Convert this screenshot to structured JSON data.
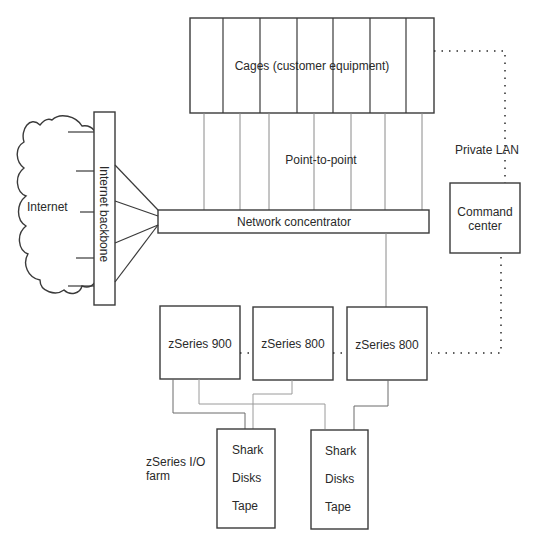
{
  "diagram": {
    "cages": {
      "label": "Cages (customer equipment)",
      "slots": 7
    },
    "point_to_point": {
      "label": "Point-to-point"
    },
    "private_lan": {
      "label": "Private LAN"
    },
    "internet": {
      "label": "Internet"
    },
    "backbone": {
      "label": "Internet backbone"
    },
    "concentrator": {
      "label": "Network concentrator"
    },
    "command_center": {
      "line1": "Command",
      "line2": "center"
    },
    "servers": [
      {
        "label": "zSeries 900"
      },
      {
        "label": "zSeries 800"
      },
      {
        "label": "zSeries 800"
      }
    ],
    "io_farm": {
      "line1": "zSeries I/O",
      "line2": "farm"
    },
    "storage": [
      {
        "items": [
          "Shark",
          "Disks",
          "Tape"
        ]
      },
      {
        "items": [
          "Shark",
          "Disks",
          "Tape"
        ]
      }
    ],
    "colors": {
      "stroke": "#3a3a3a",
      "connector": "#8a8a8a",
      "text": "#2a2a2a"
    }
  }
}
